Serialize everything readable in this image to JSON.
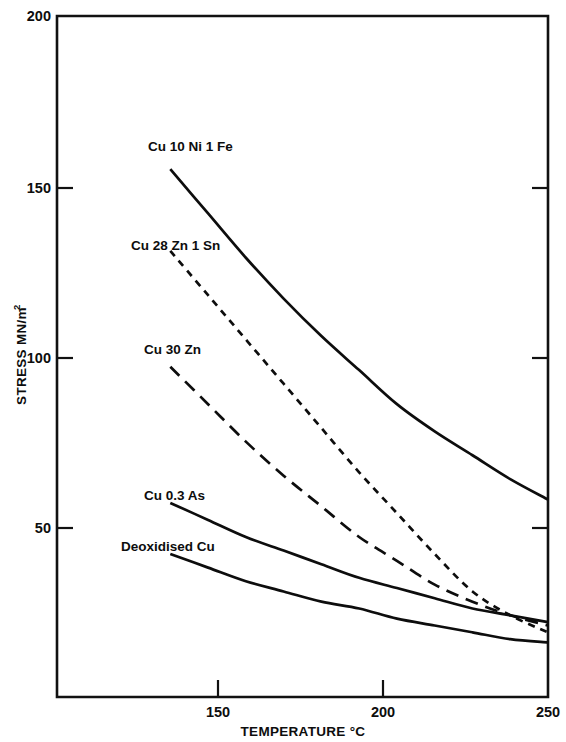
{
  "chart_data": {
    "type": "line",
    "title": "",
    "subtitle": "",
    "xlabel": "TEMPERATURE °C",
    "ylabel": "STRESS MN/m",
    "ylabel_superscript": "2",
    "xlim": [
      120,
      250
    ],
    "ylim": [
      0,
      200
    ],
    "xticks": [
      150,
      200,
      250
    ],
    "xtick_labels": [
      "150",
      "200",
      "250"
    ],
    "yticks": [
      50,
      100,
      150,
      200
    ],
    "ytick_labels": [
      "50",
      "100",
      "150",
      "200"
    ],
    "grid": false,
    "legend": "inline-labels",
    "legend_position": "inside-left",
    "x": [
      150,
      160,
      170,
      180,
      190,
      200,
      210,
      220,
      230,
      240,
      250
    ],
    "series": [
      {
        "name": "Cu 10 Ni 1 Fe",
        "label": "Cu 10 Ni 1 Fe",
        "style": "solid",
        "dasharray": "none",
        "color": "#0d0d0d",
        "values": [
          155,
          142,
          129,
          117,
          106,
          96,
          86,
          78,
          71,
          64,
          58
        ],
        "label_x": 148,
        "label_y": 151
      },
      {
        "name": "Cu 28 Zn 1 Sn",
        "label": "Cu 28 Zn 1 Sn",
        "style": "short-dash",
        "dasharray": "7,6",
        "color": "#0d0d0d",
        "values": [
          131,
          118,
          105,
          92,
          79,
          66,
          54,
          42,
          31,
          24,
          19
        ],
        "label_x": 131,
        "label_y": 250
      },
      {
        "name": "Cu 30 Zn",
        "label": "Cu 30 Zn",
        "style": "long-dash",
        "dasharray": "13,8",
        "color": "#0d0d0d",
        "values": [
          97,
          86,
          75,
          65,
          56,
          47,
          40,
          33,
          28,
          24,
          21
        ],
        "label_x": 144,
        "label_y": 354
      },
      {
        "name": "Cu 0.3 As",
        "label": "Cu 0.3 As",
        "style": "solid",
        "dasharray": "none",
        "color": "#0d0d0d",
        "values": [
          57,
          52,
          47,
          43,
          39,
          35,
          32,
          29,
          26,
          24,
          22
        ],
        "label_x": 144,
        "label_y": 500
      },
      {
        "name": "Deoxidised Cu",
        "label": "Deoxidised Cu",
        "style": "solid",
        "dasharray": "none",
        "color": "#0d0d0d",
        "values": [
          42,
          38,
          34,
          31,
          28,
          26,
          23,
          21,
          19,
          17,
          16
        ],
        "label_x": 121,
        "label_y": 551
      }
    ]
  },
  "axes": {
    "x_axis_title": "TEMPERATURE °C",
    "y_axis_title": "STRESS MN/m",
    "y_axis_title_sup": "2"
  },
  "ticks": {
    "x": [
      "150",
      "200",
      "250"
    ],
    "y": [
      "200",
      "150",
      "100",
      "50"
    ]
  },
  "colors": {
    "ink": "#0d0d0d",
    "axis": "#111111",
    "background": "#ffffff"
  }
}
